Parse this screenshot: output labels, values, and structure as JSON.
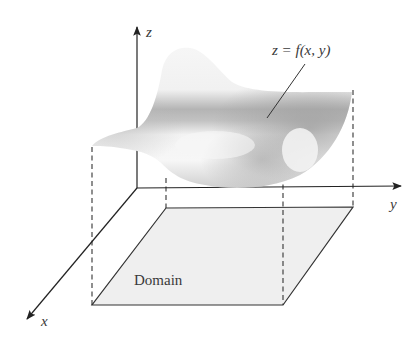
{
  "figure": {
    "type": "3d-surface-over-domain",
    "width": 410,
    "height": 346
  },
  "axes": {
    "origin": [
      137,
      188
    ],
    "x": {
      "label": "x",
      "tip": [
        25,
        321
      ]
    },
    "y": {
      "label": "y",
      "tip": [
        403,
        186
      ]
    },
    "z": {
      "label": "z",
      "tip": [
        137,
        25
      ]
    }
  },
  "labels": {
    "surface": "z = f(x, y)",
    "domain": "Domain",
    "x_axis": "x",
    "y_axis": "y",
    "z_axis": "z"
  },
  "domain_region": {
    "corners": [
      [
        166,
        208
      ],
      [
        353,
        207
      ],
      [
        283,
        305
      ],
      [
        92,
        305
      ]
    ],
    "fill": "#eeeeee",
    "stroke": "#333333"
  },
  "projection_lines": [
    {
      "x": 92,
      "y1": 147,
      "y2": 305
    },
    {
      "x": 166,
      "y1": 178,
      "y2": 208
    },
    {
      "x": 283,
      "y1": 175,
      "y2": 305
    },
    {
      "x": 353,
      "y1": 90,
      "y2": 207
    }
  ],
  "colors": {
    "line": "#333333",
    "surface_light": "#f4f4f4",
    "surface_dark": "#a8a8a8",
    "text": "#3a3a3a"
  }
}
